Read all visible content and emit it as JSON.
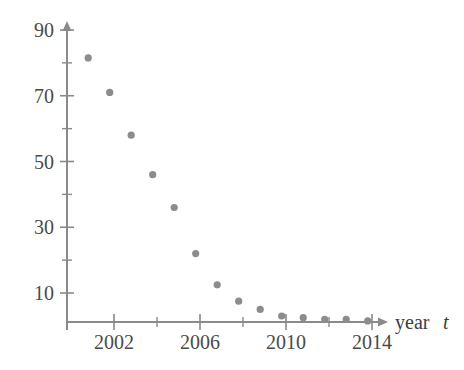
{
  "chart_data": {
    "type": "scatter",
    "title": "",
    "subtitle": "",
    "xlabel": "year t",
    "ylabel": "",
    "xlim": [
      2000.2,
      2015.4
    ],
    "ylim": [
      0,
      92
    ],
    "grid": false,
    "legend": null,
    "marker_color": "#8c8c8c",
    "axis_color": "#8a8a8a",
    "text_color": "#4a4a4a",
    "x_ticks_major": [
      2002,
      2006,
      2010,
      2014
    ],
    "x_tick_labels": [
      "2002",
      "2006",
      "2010",
      "2014"
    ],
    "x_ticks_minor": [
      2004,
      2008,
      2012
    ],
    "y_ticks_major": [
      10,
      30,
      50,
      70,
      90
    ],
    "y_tick_labels": [
      "10",
      "30",
      "50",
      "70",
      "90"
    ],
    "y_ticks_minor": [
      20,
      40,
      60,
      80
    ],
    "x": [
      2000.8,
      2001.8,
      2002.8,
      2003.8,
      2004.8,
      2005.8,
      2006.8,
      2007.8,
      2008.8,
      2009.8,
      2010.8,
      2011.8,
      2012.8,
      2013.8
    ],
    "values": [
      81.5,
      71.0,
      58.0,
      46.0,
      36.0,
      22.0,
      12.5,
      7.5,
      5.0,
      3.0,
      2.5,
      2.0,
      2.0,
      1.5
    ],
    "series": [
      {
        "name": "data",
        "points": [
          {
            "x": 2000.8,
            "y": 81.5
          },
          {
            "x": 2001.8,
            "y": 71.0
          },
          {
            "x": 2002.8,
            "y": 58.0
          },
          {
            "x": 2003.8,
            "y": 46.0
          },
          {
            "x": 2004.8,
            "y": 36.0
          },
          {
            "x": 2005.8,
            "y": 22.0
          },
          {
            "x": 2006.8,
            "y": 12.5
          },
          {
            "x": 2007.8,
            "y": 7.5
          },
          {
            "x": 2008.8,
            "y": 5.0
          },
          {
            "x": 2009.8,
            "y": 3.0
          },
          {
            "x": 2010.8,
            "y": 2.5
          },
          {
            "x": 2011.8,
            "y": 2.0
          },
          {
            "x": 2012.8,
            "y": 2.0
          },
          {
            "x": 2013.8,
            "y": 1.5
          }
        ]
      }
    ],
    "annotations": []
  },
  "axis": {
    "x_title_text": "year",
    "x_title_variable": "t"
  }
}
